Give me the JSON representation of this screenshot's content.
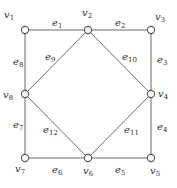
{
  "diagram": {
    "type": "graph",
    "vertices": [
      {
        "id": "v1",
        "label": "v",
        "sub": "1",
        "x": 25,
        "y": 30,
        "lx": 4,
        "ly": 18
      },
      {
        "id": "v2",
        "label": "v",
        "sub": "2",
        "x": 88,
        "y": 30,
        "lx": 82,
        "ly": 16
      },
      {
        "id": "v3",
        "label": "v",
        "sub": "3",
        "x": 151,
        "y": 30,
        "lx": 155,
        "ly": 20
      },
      {
        "id": "v4",
        "label": "v",
        "sub": "4",
        "x": 151,
        "y": 94,
        "lx": 158,
        "ly": 97
      },
      {
        "id": "v5",
        "label": "v",
        "sub": "5",
        "x": 151,
        "y": 158,
        "lx": 150,
        "ly": 174
      },
      {
        "id": "v6",
        "label": "v",
        "sub": "6",
        "x": 88,
        "y": 158,
        "lx": 83,
        "ly": 174
      },
      {
        "id": "v7",
        "label": "v",
        "sub": "7",
        "x": 25,
        "y": 158,
        "lx": 15,
        "ly": 172
      },
      {
        "id": "v8",
        "label": "v",
        "sub": "8",
        "x": 25,
        "y": 94,
        "lx": 3,
        "ly": 98
      }
    ],
    "edges": [
      {
        "id": "e1",
        "from": "v1",
        "to": "v2",
        "label": "e",
        "sub": "1",
        "lx": 52,
        "ly": 26
      },
      {
        "id": "e2",
        "from": "v2",
        "to": "v3",
        "label": "e",
        "sub": "2",
        "lx": 115,
        "ly": 26
      },
      {
        "id": "e3",
        "from": "v3",
        "to": "v4",
        "label": "e",
        "sub": "3",
        "lx": 157,
        "ly": 63
      },
      {
        "id": "e4",
        "from": "v4",
        "to": "v5",
        "label": "e",
        "sub": "4",
        "lx": 157,
        "ly": 130
      },
      {
        "id": "e5",
        "from": "v5",
        "to": "v6",
        "label": "e",
        "sub": "5",
        "lx": 115,
        "ly": 173
      },
      {
        "id": "e6",
        "from": "v6",
        "to": "v7",
        "label": "e",
        "sub": "6",
        "lx": 52,
        "ly": 173
      },
      {
        "id": "e7",
        "from": "v7",
        "to": "v8",
        "label": "e",
        "sub": "7",
        "lx": 13,
        "ly": 128
      },
      {
        "id": "e8",
        "from": "v8",
        "to": "v1",
        "label": "e",
        "sub": "8",
        "lx": 13,
        "ly": 65
      },
      {
        "id": "e9",
        "from": "v2",
        "to": "v8",
        "label": "e",
        "sub": "9",
        "lx": 45,
        "ly": 60
      },
      {
        "id": "e10",
        "from": "v2",
        "to": "v4",
        "label": "e",
        "sub": "10",
        "lx": 122,
        "ly": 60
      },
      {
        "id": "e11",
        "from": "v4",
        "to": "v6",
        "label": "e",
        "sub": "11",
        "lx": 124,
        "ly": 133
      },
      {
        "id": "e12",
        "from": "v6",
        "to": "v8",
        "label": "e",
        "sub": "12",
        "lx": 43,
        "ly": 133
      }
    ],
    "colors": {
      "edge": "#6b6b6b",
      "vertex_stroke": "#555555",
      "vertex_fill": "#ffffff",
      "text": "#333333"
    }
  }
}
